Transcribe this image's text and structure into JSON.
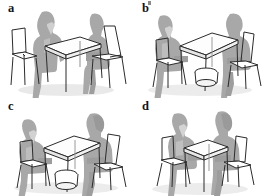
{
  "figure": {
    "type": "multi-panel-illustration",
    "panel_count": 4,
    "grid": "2x2",
    "background_color": "#ffffff",
    "colors": {
      "silhouette_fill": "#a9a9a9",
      "silhouette_dark": "#8e8e8e",
      "silhouette_light": "#c2c2c2",
      "outline_stroke": "#2b2b2b",
      "furniture_fill": "#ffffff",
      "shadow": "#bdbdbd",
      "label_color": "#141414"
    }
  },
  "panels": [
    {
      "id": "a",
      "label": "a",
      "position": "top-left",
      "caption": "Two people seated at adjacent sides of a rectangular table, chairs angled at a corner",
      "objects": {
        "person_left": "man-silhouette-seated",
        "person_right": "woman-silhouette-seated",
        "table": "rectangular-table",
        "chair_left": "outlined-chair",
        "chair_right": "outlined-chair",
        "bin": "none"
      }
    },
    {
      "id": "b",
      "label": "b",
      "position": "top-right",
      "caption": "Two people seated facing each other across a rectangular table with a round bin underneath",
      "objects": {
        "person_left": "man-silhouette-seated",
        "person_right": "woman-silhouette-seated",
        "table": "rectangular-table",
        "chair_left": "outlined-chair",
        "chair_right": "outlined-chair",
        "bin": "round-bin-under-table"
      }
    },
    {
      "id": "c",
      "label": "c",
      "position": "bottom-left",
      "caption": "Two people seated diagonally across a rectangular table with a round bin underneath",
      "objects": {
        "person_left": "man-silhouette-seated",
        "person_right": "woman-silhouette-seated",
        "table": "rectangular-table",
        "chair_left": "outlined-chair",
        "chair_right": "outlined-chair",
        "bin": "round-bin-under-table"
      }
    },
    {
      "id": "d",
      "label": "d",
      "position": "bottom-right",
      "caption": "Two people seated close together at a small square table, chairs turned inward",
      "objects": {
        "person_left": "man-silhouette-seated",
        "person_right": "woman-silhouette-seated",
        "table": "square-table",
        "chair_left": "outlined-chair",
        "chair_right": "outlined-chair",
        "bin": "none"
      }
    }
  ]
}
